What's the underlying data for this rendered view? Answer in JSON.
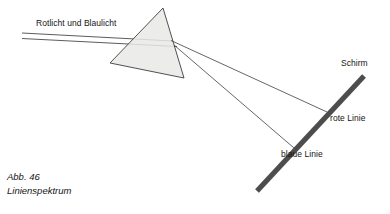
{
  "figure": {
    "caption_number": "Abb. 46",
    "caption_title": "Linienspektrum",
    "labels": {
      "incident_beam": "Rotlicht und Blaulicht",
      "screen": "Schirm",
      "red_line": "rote Linie",
      "blue_line": "blaue Linie"
    },
    "colors": {
      "prism_fill": "#e9e9e7",
      "prism_stroke": "#3d3d3d",
      "ray_stroke": "#4a4a4a",
      "screen_bar": "#4d4d4d",
      "text": "#141414",
      "background": "#ffffff"
    },
    "geometry": {
      "prism": {
        "apex": [
          163,
          8
        ],
        "bottom_left": [
          110,
          63
        ],
        "bottom_right": [
          184,
          78
        ]
      },
      "incident_beam": {
        "upper_line_start": [
          22,
          33
        ],
        "upper_line_end": [
          172,
          41
        ],
        "lower_line_start": [
          22,
          38
        ],
        "lower_line_end": [
          176,
          46
        ]
      },
      "screen_bar": {
        "top": [
          364,
          76
        ],
        "bottom": [
          257,
          191
        ],
        "thickness": 5
      },
      "refracted_rays": [
        {
          "name": "red",
          "from": [
            172,
            41
          ],
          "to": [
            326,
            112
          ]
        },
        {
          "name": "blue",
          "from": [
            174,
            45
          ],
          "to": [
            293,
            147
          ]
        }
      ]
    }
  }
}
